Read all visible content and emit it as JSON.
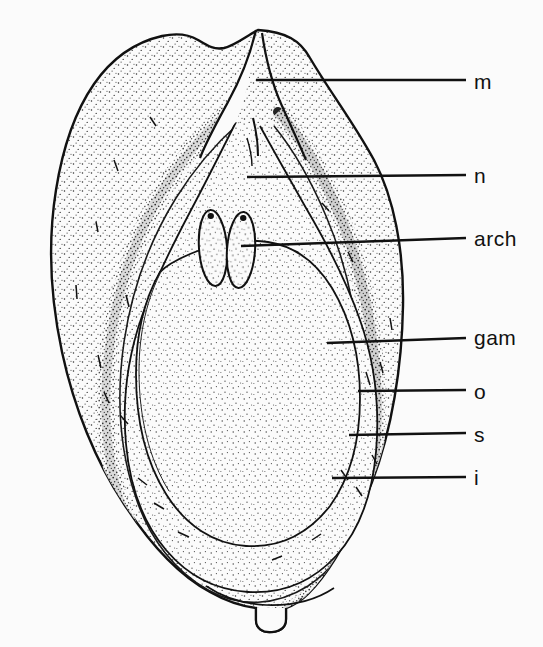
{
  "figure": {
    "kind": "botanical-line-drawing",
    "background_color": "#fbfbfb",
    "ink_color": "#111111",
    "stipple_color": "#2a2a2a"
  },
  "labels": [
    {
      "id": "m",
      "text": "m",
      "meaning": "micropyle",
      "text_x": 474,
      "text_y": 71,
      "leader": {
        "x1": 256,
        "y1": 80,
        "x2": 466,
        "y2": 80
      }
    },
    {
      "id": "n",
      "text": "n",
      "meaning": "nucellus",
      "text_x": 474,
      "text_y": 165,
      "leader": {
        "x1": 247,
        "y1": 177,
        "x2": 466,
        "y2": 175
      }
    },
    {
      "id": "arch",
      "text": "arch",
      "meaning": "archegonium",
      "text_x": 474,
      "text_y": 228,
      "leader": {
        "x1": 241,
        "y1": 246,
        "x2": 466,
        "y2": 238
      }
    },
    {
      "id": "gam",
      "text": "gam",
      "meaning": "female gametophyte",
      "text_x": 474,
      "text_y": 327,
      "leader": {
        "x1": 327,
        "y1": 343,
        "x2": 466,
        "y2": 338
      }
    },
    {
      "id": "o",
      "text": "o",
      "meaning": "outer fleshy layer of integument",
      "text_x": 474,
      "text_y": 381,
      "leader": {
        "x1": 358,
        "y1": 391,
        "x2": 466,
        "y2": 390
      }
    },
    {
      "id": "s",
      "text": "s",
      "meaning": "stony layer of integument",
      "text_x": 474,
      "text_y": 424,
      "leader": {
        "x1": 349,
        "y1": 435,
        "x2": 466,
        "y2": 433
      }
    },
    {
      "id": "i",
      "text": "i",
      "meaning": "inner fleshy layer of integument",
      "text_x": 474,
      "text_y": 467,
      "leader": {
        "x1": 332,
        "y1": 478,
        "x2": 466,
        "y2": 477
      }
    }
  ],
  "structures": {
    "ovule_outline": "M 258 30 C 286 32 300 40 310 58 C 330 92 352 120 374 160 C 394 198 404 250 403 306 C 402 366 392 430 372 482 C 352 534 330 572 308 594 C 300 602 292 606 286 608 L 286 619 C 286 626 282 631 272 632 C 262 633 256 628 256 620 L 256 608 C 240 606 224 600 210 592 C 180 576 150 544 124 504 C 96 462 74 408 62 352 C 50 296 48 240 56 190 C 63 146 76 110 94 84 C 112 58 136 42 162 36 C 176 33 188 34 198 40 C 208 46 214 50 224 48 C 236 45 246 36 258 30 Z",
    "micropyle_cleft_left": "M 256 30 C 250 54 240 76 228 96 C 216 116 206 134 200 150",
    "micropyle_cleft_right": "M 262 34 C 266 60 272 84 280 104 C 288 124 296 142 302 158",
    "nucellus_outline": "M 236 122 C 224 146 208 178 190 212 C 172 246 154 282 142 316 C 128 356 122 400 126 444 C 130 488 144 524 166 550 C 188 576 216 590 248 592 C 282 594 312 582 336 556 C 358 532 372 496 376 452 C 380 406 374 360 360 320 C 346 280 326 242 306 208 C 288 176 272 148 260 126",
    "gametophyte_outline": "M 160 272 C 144 300 136 336 136 374 C 136 420 146 462 166 494 C 186 526 214 544 246 546 C 280 548 308 534 330 506 C 350 478 360 440 360 398 C 360 356 350 318 332 288 C 316 262 294 246 268 242 C 240 238 212 244 190 254 C 176 260 166 266 160 272",
    "integument_band": "M 164 92 C 148 118 136 152 128 192 C 118 244 116 300 122 356 C 128 414 144 468 168 512 C 190 552 218 580 250 594 C 284 608 318 604 346 584 C 372 564 390 530 400 486",
    "archegonia": [
      {
        "cx": 213,
        "cy": 248,
        "rx": 14,
        "ry": 38,
        "rot": -4
      },
      {
        "cx": 241,
        "cy": 250,
        "rx": 14,
        "ry": 38,
        "rot": 4
      }
    ],
    "chalaza_notch": "M 256 608 L 256 620 C 256 628 262 633 272 632 C 282 631 286 626 286 619 L 286 608"
  }
}
